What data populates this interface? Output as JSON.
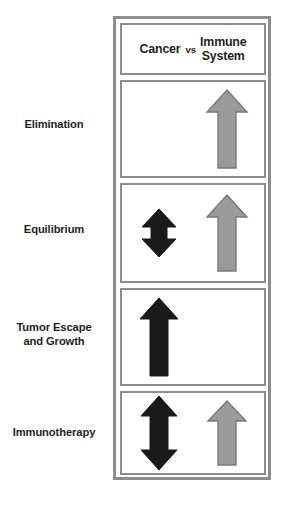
{
  "figure": {
    "colors": {
      "cancer_arrow": "#1a1a1a",
      "immune_arrow": "#9a9a9a",
      "immune_arrow_outline": "#7a7a7a",
      "frame_border": "#8c8c8c",
      "panel_background": "#ffffff",
      "label_text": "#231f20"
    }
  },
  "header": {
    "cancer_label": "Cancer",
    "vs_label": "vs",
    "immune_label_line1": "Immune",
    "immune_label_line2": "System"
  },
  "rows": [
    {
      "label_line1": "Elimination",
      "label_line2": "",
      "cancer_arrow": "none",
      "immune_arrow": "up-large"
    },
    {
      "label_line1": "Equilibrium",
      "label_line2": "",
      "cancer_arrow": "up-down-small",
      "immune_arrow": "up-large"
    },
    {
      "label_line1": "Tumor Escape",
      "label_line2": "and Growth",
      "cancer_arrow": "up-large",
      "immune_arrow": "none"
    },
    {
      "label_line1": "Immunotherapy",
      "label_line2": "",
      "cancer_arrow": "up-down-large",
      "immune_arrow": "up-large"
    }
  ]
}
